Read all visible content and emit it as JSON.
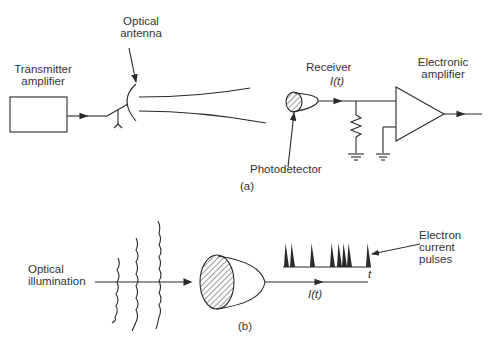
{
  "panel_a": {
    "caption": "(a)",
    "transmitter_label": [
      "Transmitter",
      "amplifier"
    ],
    "antenna_label": [
      "Optical",
      "antenna"
    ],
    "receiver_label": "Receiver",
    "receiver_signal": "I(t)",
    "amplifier_label": [
      "Electronic",
      "amplifier"
    ],
    "photodetector_label": "Photodetector"
  },
  "panel_b": {
    "caption": "(b)",
    "illumination_label": [
      "Optical",
      "illumination"
    ],
    "pulses_label": [
      "Electron",
      "current",
      "pulses"
    ],
    "time_axis_label": "t",
    "output_signal": "I(t)"
  },
  "colors": {
    "line": "#2a2a2a",
    "background": "#ffffff"
  }
}
